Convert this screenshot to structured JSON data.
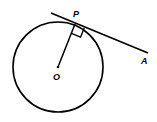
{
  "diagram": {
    "labels": {
      "center": "O",
      "tangent_point": "P",
      "external_point": "A"
    },
    "elements": [
      "circle",
      "radius-OP",
      "tangent-line-PA",
      "right-angle-marker"
    ],
    "stroke_color": "#000000",
    "background_color": "#ffffff"
  }
}
